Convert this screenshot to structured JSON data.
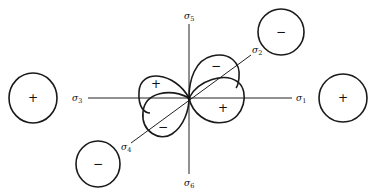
{
  "diagram": {
    "type": "orbital-lobe-diagram",
    "axes": [
      {
        "id": "sigma1",
        "label": "σ",
        "subscript": "1",
        "direction": "right"
      },
      {
        "id": "sigma2",
        "label": "σ",
        "subscript": "2",
        "direction": "upper-right diagonal"
      },
      {
        "id": "sigma3",
        "label": "σ",
        "subscript": "3",
        "direction": "left"
      },
      {
        "id": "sigma4",
        "label": "σ",
        "subscript": "4",
        "direction": "lower-left diagonal"
      },
      {
        "id": "sigma5",
        "label": "σ",
        "subscript": "5",
        "direction": "up"
      },
      {
        "id": "sigma6",
        "label": "σ",
        "subscript": "6",
        "direction": "down"
      }
    ],
    "ligand_orbitals": [
      {
        "id": "left",
        "position": "on sigma3 axis",
        "sign": "+"
      },
      {
        "id": "right",
        "position": "on sigma1 axis",
        "sign": "+"
      },
      {
        "id": "top-right",
        "position": "on sigma2 axis",
        "sign": "−"
      },
      {
        "id": "bottom-left",
        "position": "on sigma4 axis",
        "sign": "−"
      }
    ],
    "central_lobes": [
      {
        "id": "upper-left",
        "sign": "+"
      },
      {
        "id": "lower-left",
        "sign": "−"
      },
      {
        "id": "upper-right",
        "sign": "−"
      },
      {
        "id": "lower-right",
        "sign": "+"
      }
    ]
  }
}
